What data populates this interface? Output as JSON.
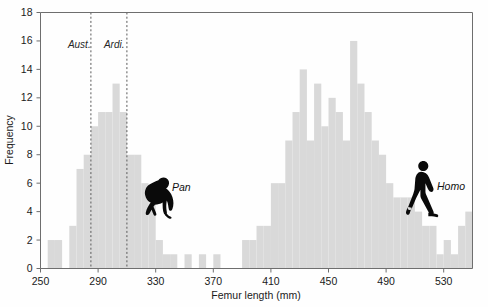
{
  "chart_data": {
    "type": "bar",
    "title": "",
    "subtitle": "",
    "xlabel": "Femur length (mm)",
    "ylabel": "Frequency",
    "xlim": [
      250,
      550
    ],
    "ylim": [
      0,
      18
    ],
    "bin_width": 5,
    "grid": false,
    "legend_position": "none",
    "bar_color": "#d9d9d9",
    "axis_color": "#6e6e6e",
    "x_ticks": [
      250,
      290,
      330,
      370,
      410,
      450,
      490,
      530
    ],
    "x_tick_labels": [
      "250",
      "290",
      "330",
      "370",
      "410",
      "450",
      "490",
      "530"
    ],
    "y_ticks": [
      0,
      2,
      4,
      6,
      8,
      10,
      12,
      14,
      16,
      18
    ],
    "y_tick_labels": [
      "0",
      "2",
      "4",
      "6",
      "8",
      "10",
      "12",
      "14",
      "16",
      "18"
    ],
    "categories": [
      250,
      255,
      260,
      265,
      270,
      275,
      280,
      285,
      290,
      295,
      300,
      305,
      310,
      315,
      320,
      325,
      330,
      335,
      340,
      345,
      350,
      355,
      360,
      365,
      370,
      375,
      380,
      385,
      390,
      395,
      400,
      405,
      410,
      415,
      420,
      425,
      430,
      435,
      440,
      445,
      450,
      455,
      460,
      465,
      470,
      475,
      480,
      485,
      490,
      495,
      500,
      505,
      510,
      515,
      520,
      525,
      530,
      535,
      540,
      545
    ],
    "values": [
      0,
      2,
      2,
      0,
      3,
      7,
      8,
      10,
      11,
      11,
      13,
      11,
      8,
      8,
      6,
      5,
      2,
      1,
      1,
      0,
      1,
      0,
      1,
      0,
      1,
      0,
      0,
      0,
      2,
      2,
      3,
      3,
      6,
      6,
      9,
      11,
      14,
      9,
      13,
      10,
      12,
      11,
      9,
      16,
      13,
      11,
      9,
      8,
      6,
      5,
      5,
      5,
      4,
      3,
      3,
      1,
      2,
      1,
      3,
      4
    ],
    "annotations": [
      {
        "name": "Aust.",
        "label": "Aust.",
        "x": 285,
        "style": "dashed-vertical"
      },
      {
        "name": "Ardi.",
        "label": "Ardi.",
        "x": 310,
        "style": "dashed-vertical"
      }
    ],
    "group_labels": [
      {
        "name": "Pan",
        "label": "Pan",
        "x": 350,
        "y": 5.4,
        "icon": "chimpanzee-silhouette"
      },
      {
        "name": "Homo",
        "label": "Homo",
        "x": 510,
        "y": 6.2,
        "icon": "walking-human-silhouette"
      }
    ]
  }
}
